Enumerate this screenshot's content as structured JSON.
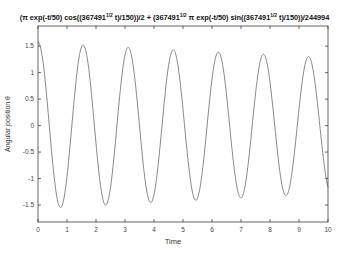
{
  "chart_data": {
    "type": "line",
    "title_parts": {
      "p1": "(π exp(-t/50) cos((367491",
      "e1": "1/2",
      "p2": " t)/150))/2 + (367491",
      "e2": "1/2",
      "p3": " π exp(-t/50) sin((367491",
      "e3": "1/2",
      "p4": " t)/150))/244994"
    },
    "xlabel": "Time",
    "ylabel": "Angular position θ",
    "xlim": [
      0,
      10
    ],
    "ylim": [
      -1.82,
      1.88
    ],
    "xticks": [
      0,
      1,
      2,
      3,
      4,
      5,
      6,
      7,
      8,
      9,
      10
    ],
    "xtick_labels": [
      "0",
      "1",
      "2",
      "3",
      "4",
      "5",
      "6",
      "7",
      "8",
      "9",
      "10"
    ],
    "yticks": [
      1.5,
      1,
      0.5,
      0,
      -0.5,
      -1,
      -1.5
    ],
    "ytick_labels": [
      "1.5",
      "1",
      "0.5",
      "0",
      "-0.5",
      "-1",
      "-1.5"
    ],
    "grid": false,
    "legend": null,
    "line_color": "#7a7a7a",
    "axis_color": "#262626",
    "function": {
      "cos_coef": 1.5707963,
      "sin_coef": 0.0077733,
      "omega": 4.0414,
      "decay_tau": 50
    },
    "series": [
      {
        "name": "theta(t)",
        "x": [
          0,
          0.5,
          1,
          1.5,
          2,
          2.5,
          3,
          3.5,
          4,
          4.5,
          5,
          5.5,
          6,
          6.5,
          7,
          7.5,
          8,
          8.5,
          9,
          9.5,
          10
        ],
        "values": [
          1.571,
          -0.669,
          -0.961,
          1.485,
          -0.34,
          -1.199,
          1.333,
          -0.002,
          -1.35,
          1.103,
          0.31,
          -1.389,
          0.84,
          0.579,
          -1.338,
          0.54,
          0.831,
          -1.254,
          0.224,
          1.025,
          -1.169
        ]
      }
    ]
  }
}
